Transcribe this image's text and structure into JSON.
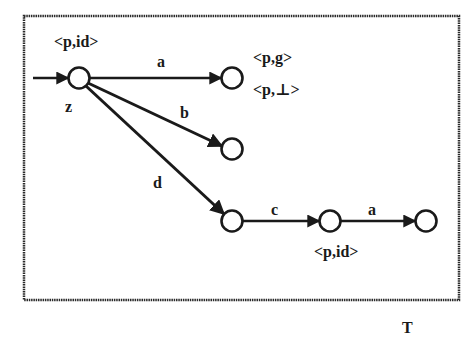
{
  "diagram": {
    "type": "automaton",
    "caption": "T",
    "states": [
      {
        "id": "s0",
        "cx": 79,
        "cy": 78,
        "label": "<p,id>",
        "label_pos": "above",
        "initial": true
      },
      {
        "id": "s1",
        "cx": 232,
        "cy": 78,
        "labels": [
          "<p,g>",
          "<p,⊥>"
        ]
      },
      {
        "id": "s2",
        "cx": 232,
        "cy": 149
      },
      {
        "id": "s3",
        "cx": 232,
        "cy": 221
      },
      {
        "id": "s4",
        "cx": 330,
        "cy": 221,
        "label": "<p,id>",
        "label_pos": "below"
      },
      {
        "id": "s5",
        "cx": 426,
        "cy": 221
      }
    ],
    "initial_arrow_label": "z",
    "transitions": [
      {
        "from": "s0",
        "to": "s1",
        "label": "a"
      },
      {
        "from": "s0",
        "to": "s2",
        "label": "b"
      },
      {
        "from": "s0",
        "to": "s3",
        "label": "d"
      },
      {
        "from": "s3",
        "to": "s4",
        "label": "c"
      },
      {
        "from": "s4",
        "to": "s5",
        "label": "a"
      }
    ],
    "labels": {
      "s0_annot": "<p,id>",
      "s1_annot_top": "<p,g>",
      "s1_annot_bottom": "<p,⊥>",
      "s4_annot": "<p,id>",
      "init_label": "z",
      "t_a1": "a",
      "t_b": "b",
      "t_d": "d",
      "t_c": "c",
      "t_a2": "a"
    },
    "colors": {
      "stroke": "#1a1a1a",
      "background": "#ffffff"
    }
  }
}
